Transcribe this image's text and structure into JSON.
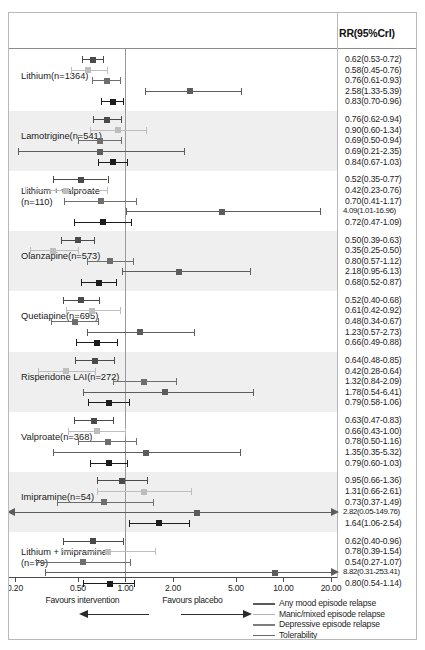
{
  "figure": {
    "column_header": "RR(95%CrI)",
    "axis": {
      "ticks": [
        0.2,
        0.5,
        1.0,
        2.0,
        5.0,
        10.0,
        20.0
      ],
      "tick_labels": [
        "0.20",
        "0.50",
        "1.00",
        "2.00",
        "5.00",
        "10.00",
        "20.00"
      ],
      "xmin": 0.2,
      "xmax": 20.0,
      "reference": 1.0,
      "scale": "log",
      "favours_left": "Favours intervention",
      "favours_right": "Favours placebo"
    },
    "legend": {
      "items": [
        {
          "label": "Any mood episode relapse",
          "color": "#5a5a5a"
        },
        {
          "label": "Manic/mixed episode relapse",
          "color": "#b4b4b4"
        },
        {
          "label": "Depressive episode relapse",
          "color": "#7e7e7e"
        },
        {
          "label": "Tolerability",
          "color": "#6a6a6a"
        },
        {
          "label": "Acceptability",
          "color": "#8e8e8e"
        }
      ]
    }
  },
  "chart_data": {
    "type": "forest",
    "title": "",
    "xlabel": "RR(95%CrI)",
    "ylabel": "",
    "xlim": [
      0.2,
      20.0
    ],
    "xscale": "log",
    "reference_line": 1.0,
    "grid": false,
    "legend_position": "bottom-right",
    "outcomes": [
      "Any mood episode relapse",
      "Manic/mixed episode relapse",
      "Depressive episode relapse",
      "Tolerability",
      "Acceptability"
    ],
    "groups": [
      {
        "label": "Lithium(n=1364)",
        "label_lines": [
          "Lithium(n=1364)"
        ],
        "shaded": false,
        "rows": [
          {
            "outcome": "Any mood episode relapse",
            "rr": 0.62,
            "lo": 0.53,
            "hi": 0.72,
            "text": "0.62(0.53-0.72)",
            "color": "#4a4a4a"
          },
          {
            "outcome": "Manic/mixed episode relapse",
            "rr": 0.58,
            "lo": 0.45,
            "hi": 0.76,
            "text": "0.58(0.45-0.76)",
            "color": "#bdbdbd"
          },
          {
            "outcome": "Depressive episode relapse",
            "rr": 0.76,
            "lo": 0.61,
            "hi": 0.93,
            "text": "0.76(0.61-0.93)",
            "color": "#6e6e6e"
          },
          {
            "outcome": "Tolerability",
            "rr": 2.58,
            "lo": 1.33,
            "hi": 5.39,
            "text": "2.58(1.33-5.39)",
            "color": "#5c5c5c"
          },
          {
            "outcome": "Acceptability",
            "rr": 0.83,
            "lo": 0.7,
            "hi": 0.96,
            "text": "0.83(0.70-0.96)",
            "color": "#1c1c1c"
          }
        ]
      },
      {
        "label": "Lamotrigine(n=541)",
        "label_lines": [
          "Lamotrigine(n=541)"
        ],
        "shaded": true,
        "rows": [
          {
            "outcome": "Any mood episode relapse",
            "rr": 0.76,
            "lo": 0.62,
            "hi": 0.94,
            "text": "0.76(0.62-0.94)",
            "color": "#4a4a4a"
          },
          {
            "outcome": "Manic/mixed episode relapse",
            "rr": 0.9,
            "lo": 0.6,
            "hi": 1.34,
            "text": "0.90(0.60-1.34)",
            "color": "#bdbdbd"
          },
          {
            "outcome": "Depressive episode relapse",
            "rr": 0.69,
            "lo": 0.5,
            "hi": 0.94,
            "text": "0.69(0.50-0.94)",
            "color": "#6e6e6e"
          },
          {
            "outcome": "Tolerability",
            "rr": 0.69,
            "lo": 0.21,
            "hi": 2.35,
            "text": "0.69(0.21-2.35)",
            "color": "#5c5c5c"
          },
          {
            "outcome": "Acceptability",
            "rr": 0.84,
            "lo": 0.67,
            "hi": 1.03,
            "text": "0.84(0.67-1.03)",
            "color": "#1c1c1c"
          }
        ]
      },
      {
        "label": "Lithium + valproate (n=110)",
        "label_lines": [
          "Lithium + valproate",
          "(n=110)"
        ],
        "shaded": false,
        "rows": [
          {
            "outcome": "Any mood episode relapse",
            "rr": 0.52,
            "lo": 0.35,
            "hi": 0.77,
            "text": "0.52(0.35-0.77)",
            "color": "#4a4a4a"
          },
          {
            "outcome": "Manic/mixed episode relapse",
            "rr": 0.42,
            "lo": 0.23,
            "hi": 0.76,
            "text": "0.42(0.23-0.76)",
            "color": "#bdbdbd"
          },
          {
            "outcome": "Depressive episode relapse",
            "rr": 0.7,
            "lo": 0.41,
            "hi": 1.17,
            "text": "0.70(0.41-1.17)",
            "color": "#6e6e6e"
          },
          {
            "outcome": "Tolerability",
            "rr": 4.09,
            "lo": 1.01,
            "hi": 16.96,
            "text": "4.09(1.01-16.96)",
            "color": "#5c5c5c"
          },
          {
            "outcome": "Acceptability",
            "rr": 0.72,
            "lo": 0.47,
            "hi": 1.09,
            "text": "0.72(0.47-1.09)",
            "color": "#1c1c1c"
          }
        ]
      },
      {
        "label": "Olanzapine(n=573)",
        "label_lines": [
          "Olanzapine(n=573)"
        ],
        "shaded": true,
        "rows": [
          {
            "outcome": "Any mood episode relapse",
            "rr": 0.5,
            "lo": 0.39,
            "hi": 0.63,
            "text": "0.50(0.39-0.63)",
            "color": "#4a4a4a"
          },
          {
            "outcome": "Manic/mixed episode relapse",
            "rr": 0.35,
            "lo": 0.25,
            "hi": 0.5,
            "text": "0.35(0.25-0.50)",
            "color": "#bdbdbd"
          },
          {
            "outcome": "Depressive episode relapse",
            "rr": 0.8,
            "lo": 0.57,
            "hi": 1.12,
            "text": "0.80(0.57-1.12)",
            "color": "#6e6e6e"
          },
          {
            "outcome": "Tolerability",
            "rr": 2.18,
            "lo": 0.95,
            "hi": 6.13,
            "text": "2.18(0.95-6.13)",
            "color": "#5c5c5c"
          },
          {
            "outcome": "Acceptability",
            "rr": 0.68,
            "lo": 0.52,
            "hi": 0.87,
            "text": "0.68(0.52-0.87)",
            "color": "#1c1c1c"
          }
        ]
      },
      {
        "label": "Quetiapine(n=695)",
        "label_lines": [
          "Quetiapine(n=695)"
        ],
        "shaded": false,
        "rows": [
          {
            "outcome": "Any mood episode relapse",
            "rr": 0.52,
            "lo": 0.4,
            "hi": 0.68,
            "text": "0.52(0.40-0.68)",
            "color": "#4a4a4a"
          },
          {
            "outcome": "Manic/mixed episode relapse",
            "rr": 0.61,
            "lo": 0.42,
            "hi": 0.92,
            "text": "0.61(0.42-0.92)",
            "color": "#bdbdbd"
          },
          {
            "outcome": "Depressive episode relapse",
            "rr": 0.48,
            "lo": 0.34,
            "hi": 0.67,
            "text": "0.48(0.34-0.67)",
            "color": "#6e6e6e"
          },
          {
            "outcome": "Tolerability",
            "rr": 1.23,
            "lo": 0.57,
            "hi": 2.73,
            "text": "1.23(0.57-2.73)",
            "color": "#5c5c5c"
          },
          {
            "outcome": "Acceptability",
            "rr": 0.66,
            "lo": 0.49,
            "hi": 0.88,
            "text": "0.66(0.49-0.88)",
            "color": "#1c1c1c"
          }
        ]
      },
      {
        "label": "Risperidone LAI(n=272)",
        "label_lines": [
          "Risperidone LAI(n=272)"
        ],
        "shaded": true,
        "rows": [
          {
            "outcome": "Any mood episode relapse",
            "rr": 0.64,
            "lo": 0.48,
            "hi": 0.85,
            "text": "0.64(0.48-0.85)",
            "color": "#4a4a4a"
          },
          {
            "outcome": "Manic/mixed episode relapse",
            "rr": 0.42,
            "lo": 0.28,
            "hi": 0.64,
            "text": "0.42(0.28-0.64)",
            "color": "#bdbdbd"
          },
          {
            "outcome": "Depressive episode relapse",
            "rr": 1.32,
            "lo": 0.84,
            "hi": 2.09,
            "text": "1.32(0.84-2.09)",
            "color": "#6e6e6e"
          },
          {
            "outcome": "Tolerability",
            "rr": 1.78,
            "lo": 0.54,
            "hi": 6.41,
            "text": "1.78(0.54-6.41)",
            "color": "#5c5c5c"
          },
          {
            "outcome": "Acceptability",
            "rr": 0.79,
            "lo": 0.58,
            "hi": 1.06,
            "text": "0.79(0.58-1.06)",
            "color": "#1c1c1c"
          }
        ]
      },
      {
        "label": "Valproate(n=368)",
        "label_lines": [
          "Valproate(n=368)"
        ],
        "shaded": false,
        "rows": [
          {
            "outcome": "Any mood episode relapse",
            "rr": 0.63,
            "lo": 0.47,
            "hi": 0.83,
            "text": "0.63(0.47-0.83)",
            "color": "#4a4a4a"
          },
          {
            "outcome": "Manic/mixed episode relapse",
            "rr": 0.66,
            "lo": 0.43,
            "hi": 1.0,
            "text": "0.66(0.43-1.00)",
            "color": "#bdbdbd"
          },
          {
            "outcome": "Depressive episode relapse",
            "rr": 0.78,
            "lo": 0.5,
            "hi": 1.16,
            "text": "0.78(0.50-1.16)",
            "color": "#6e6e6e"
          },
          {
            "outcome": "Tolerability",
            "rr": 1.35,
            "lo": 0.35,
            "hi": 5.32,
            "text": "1.35(0.35-5.32)",
            "color": "#5c5c5c"
          },
          {
            "outcome": "Acceptability",
            "rr": 0.79,
            "lo": 0.6,
            "hi": 1.03,
            "text": "0.79(0.60-1.03)",
            "color": "#1c1c1c"
          }
        ]
      },
      {
        "label": "Imipramine(n=54)",
        "label_lines": [
          "Imipramine(n=54)"
        ],
        "shaded": true,
        "rows": [
          {
            "outcome": "Any mood episode relapse",
            "rr": 0.95,
            "lo": 0.66,
            "hi": 1.36,
            "text": "0.95(0.66-1.36)",
            "color": "#4a4a4a"
          },
          {
            "outcome": "Manic/mixed episode relapse",
            "rr": 1.31,
            "lo": 0.66,
            "hi": 2.61,
            "text": "1.31(0.66-2.61)",
            "color": "#bdbdbd"
          },
          {
            "outcome": "Depressive episode relapse",
            "rr": 0.73,
            "lo": 0.37,
            "hi": 1.49,
            "text": "0.73(0.37-1.49)",
            "color": "#6e6e6e"
          },
          {
            "outcome": "Tolerability",
            "rr": 2.82,
            "lo": 0.05,
            "hi": 149.76,
            "text": "2.82(0.05-149.76)",
            "color": "#5c5c5c",
            "clip_lo": true,
            "clip_hi": true
          },
          {
            "outcome": "Acceptability",
            "rr": 1.64,
            "lo": 1.06,
            "hi": 2.54,
            "text": "1.64(1.06-2.54)",
            "color": "#1c1c1c"
          }
        ]
      },
      {
        "label": "Lithium + imipramine (n=79)",
        "label_lines": [
          "Lithium + imipramine",
          "(n=79)"
        ],
        "shaded": false,
        "rows": [
          {
            "outcome": "Any mood episode relapse",
            "rr": 0.62,
            "lo": 0.4,
            "hi": 0.96,
            "text": "0.62(0.40-0.96)",
            "color": "#4a4a4a"
          },
          {
            "outcome": "Manic/mixed episode relapse",
            "rr": 0.78,
            "lo": 0.39,
            "hi": 1.54,
            "text": "0.78(0.39-1.54)",
            "color": "#bdbdbd"
          },
          {
            "outcome": "Depressive episode relapse",
            "rr": 0.54,
            "lo": 0.27,
            "hi": 1.07,
            "text": "0.54(0.27-1.07)",
            "color": "#6e6e6e"
          },
          {
            "outcome": "Tolerability",
            "rr": 8.82,
            "lo": 0.31,
            "hi": 253.41,
            "text": "8.82(0.31-253.41)",
            "color": "#5c5c5c",
            "clip_hi": true
          },
          {
            "outcome": "Acceptability",
            "rr": 0.8,
            "lo": 0.54,
            "hi": 1.14,
            "text": "0.80(0.54-1.14)",
            "color": "#1c1c1c"
          }
        ]
      }
    ]
  }
}
